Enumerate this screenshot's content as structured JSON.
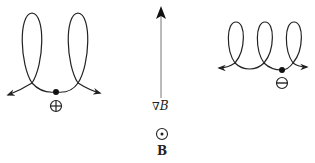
{
  "diagram": {
    "positive_particle": {
      "charge_symbol": "⊕",
      "charge": "positive",
      "loops": 2,
      "drift_direction": "left"
    },
    "negative_particle": {
      "charge_symbol": "⊖",
      "charge": "negative",
      "loops": 3,
      "drift_direction": "right"
    },
    "gradient_arrow": {
      "label_nabla": "∇",
      "label_var": "B",
      "direction": "up"
    },
    "field": {
      "symbol": "⊙",
      "label": "B",
      "direction": "out of page"
    },
    "colors": {
      "stroke": "#222222",
      "arrow": "#111111",
      "axis": "#777777"
    }
  }
}
